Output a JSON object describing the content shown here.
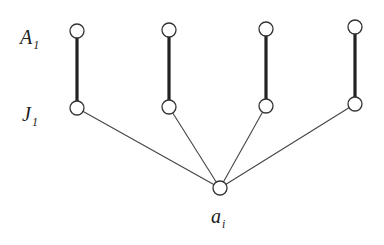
{
  "diagram": {
    "labels": {
      "top_row": {
        "main": "A",
        "sub": "1"
      },
      "bottom_row": {
        "main": "J",
        "sub": "1"
      },
      "hub": {
        "main": "a",
        "sub": "i"
      }
    },
    "columns": [
      {
        "x": 77,
        "top_y": 31,
        "bottom_y": 108
      },
      {
        "x": 169,
        "top_y": 30,
        "bottom_y": 107
      },
      {
        "x": 266,
        "top_y": 29,
        "bottom_y": 106
      },
      {
        "x": 355,
        "top_y": 27,
        "bottom_y": 104
      }
    ],
    "hub": {
      "x": 220,
      "y": 188
    },
    "node_radius": 7,
    "colors": {
      "background": "#ffffff",
      "stroke": "#333333",
      "text": "#222222"
    }
  }
}
